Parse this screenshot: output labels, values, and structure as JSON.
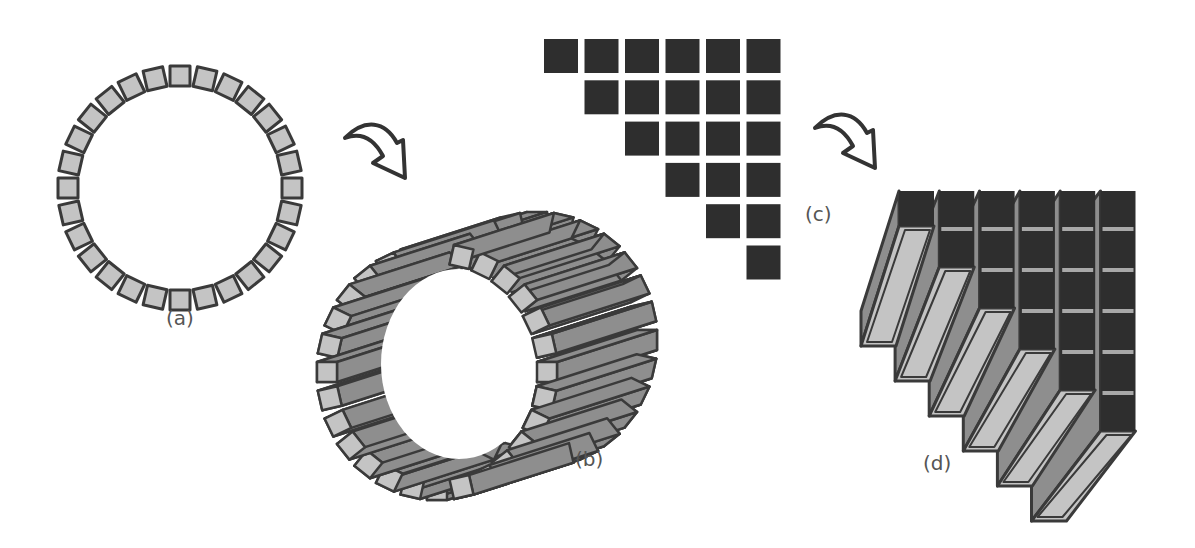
{
  "figure": {
    "panels": [
      {
        "id": "a",
        "label": "(a)",
        "description": "Ring of square elements (cross-section view)",
        "element_count": 28
      },
      {
        "id": "b",
        "label": "(b)",
        "description": "Cylinder formed by extruding ring elements into bars",
        "element_count": 28
      },
      {
        "id": "c",
        "label": "(c)",
        "description": "Upper-triangular grid of square elements",
        "rows": 6,
        "columns": 6,
        "element_count": 21
      },
      {
        "id": "d",
        "label": "(d)",
        "description": "Triangular grid extruded into 3D bars",
        "rows": 6,
        "columns": 6
      }
    ],
    "arrows": [
      {
        "id": "arrow-a-to-b",
        "from": "a",
        "to": "b"
      },
      {
        "id": "arrow-c-to-d",
        "from": "c",
        "to": "d"
      }
    ],
    "colors": {
      "outline": "#3a3a3a",
      "light_fill": "#c4c4c4",
      "bar_fill": "#8e8e8e",
      "dark_fill": "#2e2e2e",
      "label": "#555555"
    }
  }
}
